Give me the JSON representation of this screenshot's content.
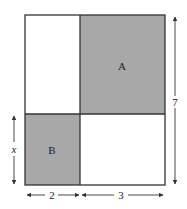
{
  "diagram": {
    "regions": [
      {
        "label": "A",
        "shaded": true
      },
      {
        "label": "B",
        "shaded": true
      }
    ],
    "dimensions": {
      "width_left": "2",
      "width_right": "3",
      "height_total": "7",
      "height_bottom": "x"
    },
    "colors": {
      "shade": "#a8a8a8",
      "line": "#333333",
      "background": "#ffffff"
    }
  }
}
